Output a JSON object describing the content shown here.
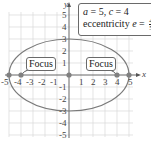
{
  "diagram": {
    "type": "ellipse",
    "a": 5,
    "c": 4,
    "b": 3,
    "annotation": {
      "line1": "a = 5, c = 4",
      "line1_parts": {
        "a_var": "a",
        "a_eq": " = 5, ",
        "c_var": "c",
        "c_eq": " = 4"
      },
      "line2_prefix": "eccentricity ",
      "line2_var": "e",
      "line2_eq": " = ",
      "fraction_num": "4",
      "fraction_den": "5"
    },
    "focus_labels": [
      "Focus",
      "Focus"
    ],
    "foci": [
      [
        -4,
        0
      ],
      [
        4,
        0
      ]
    ],
    "vertices": [
      [
        -5,
        0
      ],
      [
        5,
        0
      ]
    ],
    "center": [
      0,
      0
    ],
    "axes": {
      "x_label": "x",
      "y_label": "y",
      "x_ticks": [
        "-5",
        "-4",
        "-3",
        "-2",
        "-1",
        "1",
        "2",
        "3",
        "4",
        "5"
      ],
      "y_ticks": [
        "5",
        "4",
        "3",
        "2",
        "1",
        "-1",
        "-2",
        "-3",
        "-4",
        "-5"
      ],
      "x_range": [
        -5,
        5
      ],
      "y_range": [
        -5,
        5
      ]
    },
    "colors": {
      "ellipse": "#7a7a7a",
      "grid": "#d8d8d8",
      "axis": "#555555",
      "points": "#808080"
    }
  }
}
